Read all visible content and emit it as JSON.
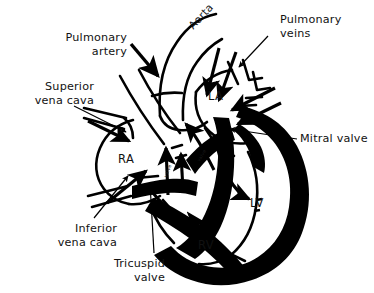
{
  "figure": {
    "background_color": "#ffffff",
    "ink_color": "#000000",
    "width": 374,
    "height": 293
  },
  "labels": {
    "pulmonary_artery": "Pulmonary\nartery",
    "pulmonary_artery_line1": "Pulmonary",
    "pulmonary_artery_line2": "artery",
    "superior_vena_cava_line1": "Superior",
    "superior_vena_cava_line2": "vena cava",
    "inferior_vena_cava_line1": "Inferior",
    "inferior_vena_cava_line2": "vena cava",
    "tricuspid_valve_line1": "Tricuspid",
    "tricuspid_valve_line2": "valve",
    "pulmonary_veins_line1": "Pulmonary",
    "pulmonary_veins_line2": "veins",
    "mitral_valve": "Mitral valve",
    "aorta": "Aorta",
    "aortic_valve_inline": "valve",
    "pulmonic_valve_inline": "valve"
  },
  "chambers": {
    "right_atrium": "RA",
    "left_atrium": "LA",
    "right_ventricle": "RV",
    "left_ventricle": "LV"
  }
}
